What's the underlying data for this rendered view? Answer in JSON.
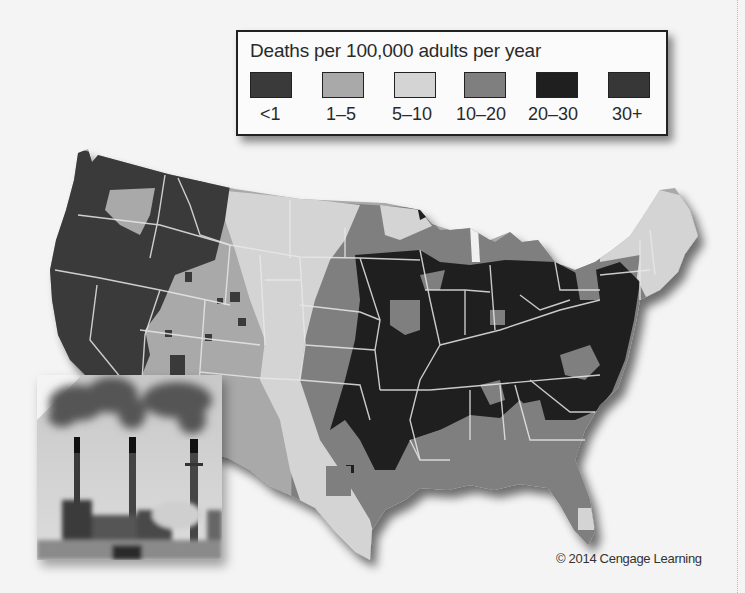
{
  "legend": {
    "title": "Deaths per 100,000 adults per year",
    "items": [
      {
        "label": "<1",
        "color": "#3a3a3a"
      },
      {
        "label": "1–5",
        "color": "#a9a9a9"
      },
      {
        "label": "5–10",
        "color": "#d4d4d4"
      },
      {
        "label": "10–20",
        "color": "#7f7f7f"
      },
      {
        "label": "20–30",
        "color": "#1f1f1f"
      },
      {
        "label": "30+",
        "color": "#373737"
      }
    ]
  },
  "map": {
    "subject": "Contiguous United States, county-level premature deaths from coal-fired power plant pollution",
    "dominant_regions": {
      "pacific_northwest_and_nevada_west": "<1",
      "mountain_west": "1–5",
      "great_plains_and_texas_panhandle": "5–10",
      "central_plains_upper_midwest_gulf_coast_florida": "10–20",
      "ohio_valley_mississippi_valley_southeast": "20–30 / 30+",
      "new_england": "5–10"
    }
  },
  "photo": {
    "subject": "coal-fired power plant with three smokestacks emitting smoke",
    "icon": "smokestack-photo"
  },
  "credit": "© 2014 Cengage Learning"
}
